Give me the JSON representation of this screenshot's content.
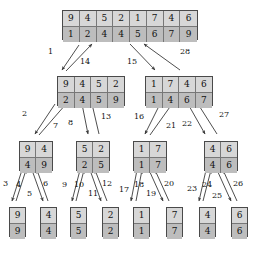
{
  "figure": {
    "colors": {
      "box_border": "#4a4a4a",
      "cell_divider": "#777777",
      "row_top_fill": "#d7d7d7",
      "row_bottom_fill": "#bdbdbd",
      "arrow": "#3a3a3a",
      "text": "#111111",
      "background": "#ffffff"
    }
  },
  "nodes": [
    {
      "id": "root",
      "level": 0,
      "x": 62,
      "y": 10,
      "cell_w": 17,
      "cell_h": 15,
      "unsorted": [
        "9",
        "4",
        "5",
        "2",
        "1",
        "7",
        "4",
        "6"
      ],
      "sorted": [
        "1",
        "2",
        "4",
        "4",
        "5",
        "6",
        "7",
        "9"
      ]
    },
    {
      "id": "L",
      "level": 1,
      "x": 57,
      "y": 76,
      "cell_w": 17,
      "cell_h": 15,
      "unsorted": [
        "9",
        "4",
        "5",
        "2"
      ],
      "sorted": [
        "2",
        "4",
        "5",
        "9"
      ]
    },
    {
      "id": "R",
      "level": 1,
      "x": 145,
      "y": 76,
      "cell_w": 17,
      "cell_h": 15,
      "unsorted": [
        "1",
        "7",
        "4",
        "6"
      ],
      "sorted": [
        "1",
        "4",
        "6",
        "7"
      ]
    },
    {
      "id": "LL",
      "level": 2,
      "x": 19,
      "y": 141,
      "cell_w": 17,
      "cell_h": 15,
      "unsorted": [
        "9",
        "4"
      ],
      "sorted": [
        "4",
        "9"
      ]
    },
    {
      "id": "LR",
      "level": 2,
      "x": 76,
      "y": 141,
      "cell_w": 17,
      "cell_h": 15,
      "unsorted": [
        "5",
        "2"
      ],
      "sorted": [
        "2",
        "5"
      ]
    },
    {
      "id": "RL",
      "level": 2,
      "x": 133,
      "y": 141,
      "cell_w": 17,
      "cell_h": 15,
      "unsorted": [
        "1",
        "7"
      ],
      "sorted": [
        "1",
        "7"
      ]
    },
    {
      "id": "RR",
      "level": 2,
      "x": 204,
      "y": 141,
      "cell_w": 17,
      "cell_h": 15,
      "unsorted": [
        "4",
        "6"
      ],
      "sorted": [
        "4",
        "6"
      ]
    },
    {
      "id": "LLL",
      "level": 3,
      "x": 9,
      "y": 207,
      "cell_w": 17,
      "cell_h": 15,
      "unsorted": [
        "9"
      ],
      "sorted": [
        "9"
      ]
    },
    {
      "id": "LLR",
      "level": 3,
      "x": 40,
      "y": 207,
      "cell_w": 17,
      "cell_h": 15,
      "unsorted": [
        "4"
      ],
      "sorted": [
        "4"
      ]
    },
    {
      "id": "LRL",
      "level": 3,
      "x": 70,
      "y": 207,
      "cell_w": 17,
      "cell_h": 15,
      "unsorted": [
        "5"
      ],
      "sorted": [
        "5"
      ]
    },
    {
      "id": "LRR",
      "level": 3,
      "x": 102,
      "y": 207,
      "cell_w": 17,
      "cell_h": 15,
      "unsorted": [
        "2"
      ],
      "sorted": [
        "2"
      ]
    },
    {
      "id": "RLL",
      "level": 3,
      "x": 133,
      "y": 207,
      "cell_w": 17,
      "cell_h": 15,
      "unsorted": [
        "1"
      ],
      "sorted": [
        "1"
      ]
    },
    {
      "id": "RLR",
      "level": 3,
      "x": 166,
      "y": 207,
      "cell_w": 17,
      "cell_h": 15,
      "unsorted": [
        "7"
      ],
      "sorted": [
        "7"
      ]
    },
    {
      "id": "RRL",
      "level": 3,
      "x": 199,
      "y": 207,
      "cell_w": 17,
      "cell_h": 15,
      "unsorted": [
        "4"
      ],
      "sorted": [
        "4"
      ]
    },
    {
      "id": "RRR",
      "level": 3,
      "x": 231,
      "y": 207,
      "cell_w": 17,
      "cell_h": 15,
      "unsorted": [
        "6"
      ],
      "sorted": [
        "6"
      ]
    }
  ],
  "edges": [
    {
      "id": "e1",
      "label": "1",
      "dir": "down",
      "from": "root",
      "to": "L",
      "x1": 79,
      "y1": 45,
      "x2": 62,
      "y2": 70,
      "lx": 48,
      "ly": 48
    },
    {
      "id": "e14",
      "label": "14",
      "dir": "up",
      "from": "L",
      "to": "root",
      "x1": 66,
      "y1": 71,
      "x2": 92,
      "y2": 44,
      "lx": 80,
      "ly": 58
    },
    {
      "id": "e15",
      "label": "15",
      "dir": "down",
      "from": "root",
      "to": "R",
      "x1": 130,
      "y1": 44,
      "x2": 155,
      "y2": 70,
      "lx": 127,
      "ly": 58
    },
    {
      "id": "e28",
      "label": "28",
      "dir": "up",
      "from": "R",
      "to": "root",
      "x1": 180,
      "y1": 70,
      "x2": 144,
      "y2": 44,
      "lx": 180,
      "ly": 48
    },
    {
      "id": "e2",
      "label": "2",
      "dir": "down",
      "from": "L",
      "to": "LL",
      "x1": 55,
      "y1": 104,
      "x2": 35,
      "y2": 134,
      "lx": 22,
      "ly": 110
    },
    {
      "id": "e7",
      "label": "7",
      "dir": "up",
      "from": "LL",
      "to": "L",
      "x1": 39,
      "y1": 135,
      "x2": 66,
      "y2": 104,
      "lx": 53,
      "ly": 122
    },
    {
      "id": "e8",
      "label": "8",
      "dir": "down",
      "from": "L",
      "to": "LR",
      "x1": 82,
      "y1": 104,
      "x2": 88,
      "y2": 134,
      "lx": 68,
      "ly": 119
    },
    {
      "id": "e13",
      "label": "13",
      "dir": "up",
      "from": "LR",
      "to": "L",
      "x1": 99,
      "y1": 134,
      "x2": 92,
      "y2": 104,
      "lx": 101,
      "ly": 113
    },
    {
      "id": "e16",
      "label": "16",
      "dir": "down",
      "from": "R",
      "to": "RL",
      "x1": 160,
      "y1": 104,
      "x2": 145,
      "y2": 134,
      "lx": 134,
      "ly": 113
    },
    {
      "id": "e21",
      "label": "21",
      "dir": "up",
      "from": "RL",
      "to": "R",
      "x1": 150,
      "y1": 135,
      "x2": 172,
      "y2": 104,
      "lx": 166,
      "ly": 122
    },
    {
      "id": "e22",
      "label": "22",
      "dir": "down",
      "from": "R",
      "to": "RR",
      "x1": 188,
      "y1": 104,
      "x2": 205,
      "y2": 134,
      "lx": 182,
      "ly": 120
    },
    {
      "id": "e27",
      "label": "27",
      "dir": "up",
      "from": "RR",
      "to": "R",
      "x1": 217,
      "y1": 134,
      "x2": 198,
      "y2": 104,
      "lx": 219,
      "ly": 111
    },
    {
      "id": "e3",
      "label": "3",
      "dir": "down",
      "from": "LL",
      "to": "LLL",
      "x1": 22,
      "y1": 170,
      "x2": 12,
      "y2": 201,
      "lx": 3,
      "ly": 180
    },
    {
      "id": "e4",
      "label": "4",
      "dir": "up",
      "from": "LLL",
      "to": "LL",
      "x1": 16,
      "y1": 201,
      "x2": 26,
      "y2": 170,
      "lx": 16,
      "ly": 181
    },
    {
      "id": "e5",
      "label": "5",
      "dir": "down",
      "from": "LL",
      "to": "LLR",
      "x1": 32,
      "y1": 170,
      "x2": 43,
      "y2": 201,
      "lx": 27,
      "ly": 190
    },
    {
      "id": "e6",
      "label": "6",
      "dir": "up",
      "from": "LLR",
      "to": "LL",
      "x1": 48,
      "y1": 201,
      "x2": 37,
      "y2": 170,
      "lx": 43,
      "ly": 180
    },
    {
      "id": "e9",
      "label": "9",
      "dir": "down",
      "from": "LR",
      "to": "LRL",
      "x1": 80,
      "y1": 170,
      "x2": 72,
      "y2": 201,
      "lx": 62,
      "ly": 181
    },
    {
      "id": "e10",
      "label": "10",
      "dir": "up",
      "from": "LRL",
      "to": "LR",
      "x1": 76,
      "y1": 201,
      "x2": 84,
      "y2": 170,
      "lx": 74,
      "ly": 181
    },
    {
      "id": "e11",
      "label": "11",
      "dir": "down",
      "from": "LR",
      "to": "LRR",
      "x1": 90,
      "y1": 170,
      "x2": 101,
      "y2": 201,
      "lx": 88,
      "ly": 190
    },
    {
      "id": "e12",
      "label": "12",
      "dir": "up",
      "from": "LRR",
      "to": "LR",
      "x1": 107,
      "y1": 201,
      "x2": 95,
      "y2": 170,
      "lx": 102,
      "ly": 180
    },
    {
      "id": "e17",
      "label": "17",
      "dir": "down",
      "from": "RL",
      "to": "RLL",
      "x1": 137,
      "y1": 170,
      "x2": 131,
      "y2": 201,
      "lx": 119,
      "ly": 186
    },
    {
      "id": "e18",
      "label": "18",
      "dir": "up",
      "from": "RLL",
      "to": "RL",
      "x1": 136,
      "y1": 201,
      "x2": 142,
      "y2": 170,
      "lx": 134,
      "ly": 181
    },
    {
      "id": "e19",
      "label": "19",
      "dir": "down",
      "from": "RL",
      "to": "RLR",
      "x1": 149,
      "y1": 170,
      "x2": 163,
      "y2": 201,
      "lx": 146,
      "ly": 190
    },
    {
      "id": "e20",
      "label": "20",
      "dir": "up",
      "from": "RLR",
      "to": "RL",
      "x1": 169,
      "y1": 201,
      "x2": 155,
      "y2": 170,
      "lx": 164,
      "ly": 180
    },
    {
      "id": "e23",
      "label": "23",
      "dir": "down",
      "from": "RR",
      "to": "RRL",
      "x1": 206,
      "y1": 170,
      "x2": 199,
      "y2": 201,
      "lx": 187,
      "ly": 185
    },
    {
      "id": "e24",
      "label": "24",
      "dir": "up",
      "from": "RRL",
      "to": "RR",
      "x1": 203,
      "y1": 201,
      "x2": 211,
      "y2": 170,
      "lx": 202,
      "ly": 181
    },
    {
      "id": "e25",
      "label": "25",
      "dir": "down",
      "from": "RR",
      "to": "RRR",
      "x1": 217,
      "y1": 170,
      "x2": 231,
      "y2": 201,
      "lx": 212,
      "ly": 192
    },
    {
      "id": "e26",
      "label": "26",
      "dir": "up",
      "from": "RRR",
      "to": "RR",
      "x1": 237,
      "y1": 201,
      "x2": 223,
      "y2": 170,
      "lx": 233,
      "ly": 180
    }
  ]
}
